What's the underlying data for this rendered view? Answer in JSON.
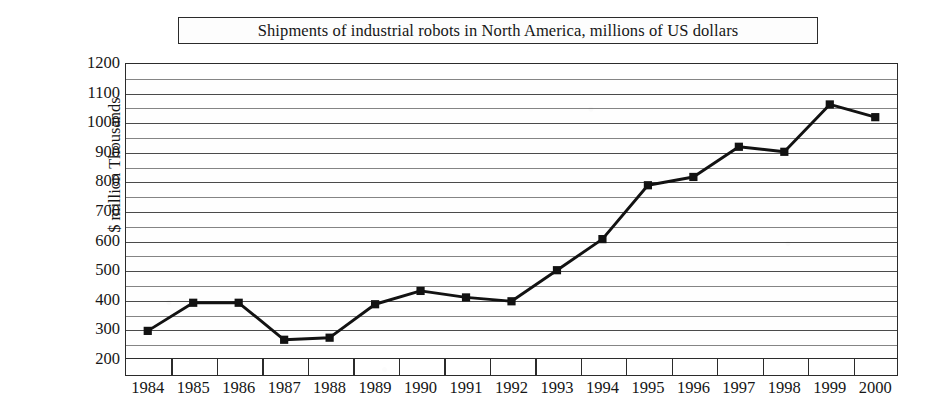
{
  "chart_data": {
    "type": "line",
    "title": "Shipments of industrial robots in North America, millions of US dollars",
    "xlabel": "",
    "ylabel_lines": [
      "$ million",
      "Thousands"
    ],
    "categories": [
      "1984",
      "1985",
      "1986",
      "1987",
      "1988",
      "1989",
      "1990",
      "1991",
      "1992",
      "1993",
      "1994",
      "1995",
      "1996",
      "1997",
      "1998",
      "1999",
      "2000"
    ],
    "values": [
      295,
      390,
      390,
      265,
      272,
      385,
      430,
      408,
      395,
      500,
      605,
      787,
      815,
      917,
      900,
      1060,
      1017
    ],
    "ylim": [
      200,
      1200
    ],
    "y_major_ticks": [
      200,
      300,
      400,
      500,
      600,
      700,
      800,
      900,
      1000,
      1100,
      1200
    ],
    "y_minor_step": 50,
    "grid": true,
    "legend": "none",
    "series": [
      {
        "name": "Shipments",
        "values": [
          295,
          390,
          390,
          265,
          272,
          385,
          430,
          408,
          395,
          500,
          605,
          787,
          815,
          917,
          900,
          1060,
          1017
        ],
        "line_color": "#121212",
        "marker": "square",
        "marker_color": "#121212"
      }
    ],
    "colors": {
      "line": "#121212",
      "marker": "#121212",
      "grid": "#4a4a4a",
      "frame": "#2b2b2b",
      "text": "#161616",
      "background": "#ffffff"
    }
  }
}
